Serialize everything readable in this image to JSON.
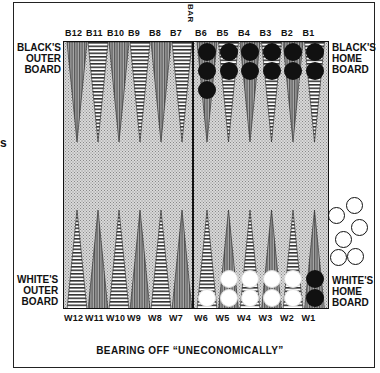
{
  "diagram": {
    "title": "BEARING OFF “UNECONOMICALLY”",
    "bar_label": "BAR",
    "cropped_left_text": "s",
    "labels": {
      "black_outer": [
        "BLACK'S",
        "OUTER",
        "BOARD"
      ],
      "black_home": [
        "BLACK'S",
        "HOME",
        "BOARD"
      ],
      "white_outer": [
        "WHITE'S",
        "OUTER",
        "BOARD"
      ],
      "white_home": [
        "WHITE'S",
        "HOME",
        "BOARD"
      ]
    },
    "top_points": [
      "B12",
      "B11",
      "B10",
      "B9",
      "B8",
      "B7",
      "B6",
      "B5",
      "B4",
      "B3",
      "B2",
      "B1"
    ],
    "bottom_points": [
      "W12",
      "W11",
      "W10",
      "W9",
      "W8",
      "W7",
      "W6",
      "W5",
      "W4",
      "W3",
      "W2",
      "W1"
    ],
    "checkers": {
      "black_on_board": {
        "B6": 3,
        "B5": 2,
        "B4": 2,
        "B3": 2,
        "B2": 2,
        "B1": 2,
        "W1": 2
      },
      "white_on_board": {
        "W6": 1,
        "W5": 2,
        "W4": 2,
        "W3": 2,
        "W2": 2
      },
      "white_borne_off": 6
    },
    "colors": {
      "black_checker": "#111111",
      "white_checker": "#ffffff",
      "board_stipple": "#d8d8d8",
      "point": "#777777"
    }
  }
}
